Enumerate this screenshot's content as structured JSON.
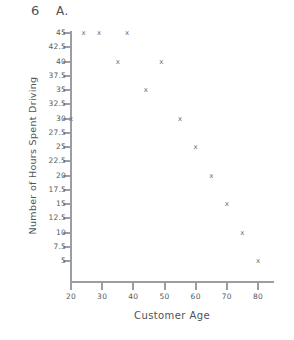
{
  "header": {
    "problem_number": "6",
    "problem_letter": "A."
  },
  "chart_data": {
    "type": "scatter",
    "title": "",
    "xlabel": "Customer Age",
    "ylabel": "Number of Hours Spent Driving",
    "xlim": [
      15,
      85
    ],
    "ylim": [
      2.5,
      46.5
    ],
    "grid": false,
    "legend": "none",
    "marker": "x",
    "marker_color": "#6a6f74",
    "axis_color": "#9a9ea2",
    "xticks": [
      20,
      30,
      40,
      50,
      60,
      70,
      80
    ],
    "xtick_labels": [
      "20",
      "30",
      "40",
      "50",
      "60",
      "70",
      "80"
    ],
    "yticks": [
      5,
      7.5,
      10,
      12.5,
      15,
      17.5,
      20,
      22.5,
      25,
      27.5,
      30,
      32.5,
      35,
      37.5,
      40,
      42.5,
      45
    ],
    "ytick_labels": [
      "5",
      "7.5",
      "10",
      "12.5",
      "15",
      "17.5",
      "20",
      "22.5",
      "25",
      "27.5",
      "30",
      "32.5",
      "35",
      "37.5",
      "40",
      "42.5",
      "45"
    ],
    "points": [
      {
        "x": 20,
        "y": 30
      },
      {
        "x": 24,
        "y": 45
      },
      {
        "x": 29,
        "y": 45
      },
      {
        "x": 35,
        "y": 40
      },
      {
        "x": 38,
        "y": 45
      },
      {
        "x": 44,
        "y": 35
      },
      {
        "x": 49,
        "y": 40
      },
      {
        "x": 55,
        "y": 30
      },
      {
        "x": 60,
        "y": 25
      },
      {
        "x": 65,
        "y": 20
      },
      {
        "x": 70,
        "y": 15
      },
      {
        "x": 75,
        "y": 10
      },
      {
        "x": 80,
        "y": 5
      }
    ]
  }
}
